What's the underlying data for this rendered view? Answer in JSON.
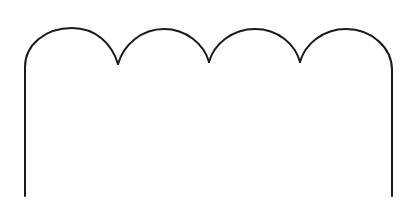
{
  "diagram": {
    "shape": "scalloped-arch-outline",
    "arch_count": 4,
    "stroke_color": "#1a1a1a",
    "background_color": "#ffffff",
    "stroke_width": 2
  }
}
